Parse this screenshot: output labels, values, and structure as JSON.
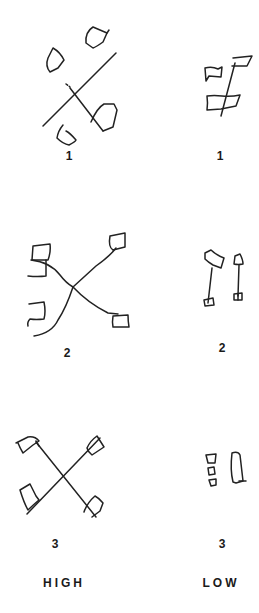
{
  "figure": {
    "columns": [
      {
        "key": "high",
        "heading": "HIGH"
      },
      {
        "key": "low",
        "heading": "LOW"
      }
    ],
    "rows": [
      {
        "number": "1",
        "high_label": "1",
        "low_label": "1"
      },
      {
        "number": "2",
        "high_label": "2",
        "low_label": "2"
      },
      {
        "number": "3",
        "high_label": "3",
        "low_label": "3"
      }
    ],
    "drawings": {
      "high_1": "crossed-sticks-with-four-flags",
      "low_1": "single-pole-with-three-flags",
      "high_2": "curved-crossed-lines-with-four-square-flags",
      "low_2": "two-poles-with-flags",
      "high_3": "crossed-sticks-with-four-flags",
      "low_3": "small-squares-and-elongated-shape"
    },
    "stroke_color": "#222222",
    "background_color": "#ffffff"
  }
}
